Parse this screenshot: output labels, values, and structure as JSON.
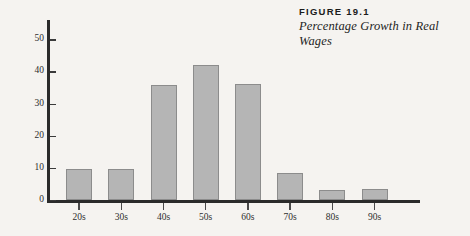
{
  "caption": {
    "label": "FIGURE 19.1",
    "title": "Percentage Growth in Real Wages"
  },
  "chart_data": {
    "type": "bar",
    "title": "Percentage Growth in Real Wages",
    "figure_label": "FIGURE 19.1",
    "categories": [
      "20s",
      "30s",
      "40s",
      "50s",
      "60s",
      "70s",
      "80s",
      "90s"
    ],
    "values": [
      9.5,
      9.8,
      35.8,
      42,
      36.2,
      8.5,
      3.2,
      3.5
    ],
    "xlabel": "",
    "ylabel": "",
    "ylim": [
      0,
      56
    ],
    "yticks": [
      0,
      10,
      20,
      30,
      40,
      50
    ],
    "ytick_labels": [
      "0",
      "10",
      "20",
      "30",
      "40",
      "50"
    ],
    "grid": false,
    "legend": false,
    "bar_color": "#b5b5b5",
    "bar_border_color": "#8c8c8c",
    "axis_color": "#2b2b2b",
    "background_color": "#f5f3f0"
  }
}
